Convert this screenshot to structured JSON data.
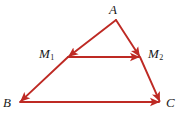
{
  "figure": {
    "background_color": "#ffffff",
    "stroke_color": "#be2a24",
    "label_color": "#191919",
    "width": 185,
    "height": 118
  },
  "labels": {
    "A": {
      "text": "A",
      "sub": ""
    },
    "M1": {
      "text": "M",
      "sub": "1"
    },
    "M2": {
      "text": "M",
      "sub": "2"
    },
    "B": {
      "text": "B",
      "sub": ""
    },
    "C": {
      "text": "C",
      "sub": ""
    }
  },
  "chart_data": {
    "type": "diagram",
    "points": [
      {
        "name": "A",
        "x": 116,
        "y": 20,
        "label": "A"
      },
      {
        "name": "M1",
        "x": 68,
        "y": 57,
        "label": "M1"
      },
      {
        "name": "M2",
        "x": 140,
        "y": 57,
        "label": "M2"
      },
      {
        "name": "B",
        "x": 20,
        "y": 102,
        "label": "B"
      },
      {
        "name": "C",
        "x": 160,
        "y": 102,
        "label": "C"
      }
    ],
    "vectors": [
      {
        "name": "A-to-M1",
        "from": "A",
        "to": "M1",
        "arrow": "end"
      },
      {
        "name": "M1-to-B",
        "from": "M1",
        "to": "B",
        "arrow": "end"
      },
      {
        "name": "A-to-M2",
        "from": "A",
        "to": "M2",
        "arrow": "end"
      },
      {
        "name": "M2-to-C",
        "from": "M2",
        "to": "C",
        "arrow": "end"
      },
      {
        "name": "M1-to-M2",
        "from": "M1",
        "to": "M2",
        "arrow": "end"
      },
      {
        "name": "B-to-C",
        "from": "B",
        "to": "C",
        "arrow": "end"
      }
    ],
    "stroke_color": "#be2a24",
    "stroke_width": 1.9
  }
}
